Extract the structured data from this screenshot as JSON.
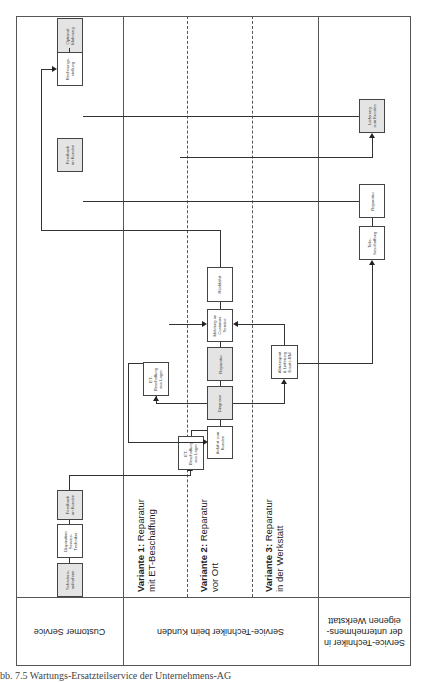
{
  "diagram": {
    "orientation": "rotated-90",
    "lanes_header": [
      {
        "id": "customer-service",
        "label": "Customer Service"
      },
      {
        "id": "service-techniker-kunden",
        "label": "Service-Techniker beim Kunden"
      },
      {
        "id": "service-techniker-werkstatt",
        "label": "Service-Techniker in\nder unternehmens-\neigenen Werkstatt"
      }
    ],
    "variants": [
      {
        "id": "variante-1",
        "bold": "Variante 1:",
        "rest": " Reparatur",
        "line2": "mit ET-Beschaffung"
      },
      {
        "id": "variante-2",
        "bold": "Variante 2:",
        "rest": " Reparatur",
        "line2": "vor Ort"
      },
      {
        "id": "variante-3",
        "bold": "Variante 3:",
        "rest": " Reparatur",
        "line2": "in der Werkstatt"
      }
    ],
    "boxes": {
      "schadensaufnahme": "Schadens-\naufnahme",
      "disposition": "Disposition\nService-\nTechniker",
      "feedback_1": "Feedback\nan Kunden",
      "feedback_2": "Feedback\nan Kunden",
      "rechnungsstellung": "Rechnungs-\nstellung",
      "optional_mahnung": "Optional:\nMahnung",
      "et_lager": "ET-\nBeschaffung\naus Lager",
      "anfahrt": "Anfahrt zum\nKunden",
      "diagnose": "Diagnose",
      "reparatur": "Reparatur",
      "meldung": "Meldung an\nCustomer\nService",
      "rueckfahrt": "Rückfahrt",
      "et_auslager": "ET-\nBeschaffung\naus Lager",
      "abtransport": "Abtransport\n& Lieferung\nErsatz-RM",
      "teilebeschaffung": "Teile-\nbeschaffung",
      "reparatur_werkstatt": "Reparatur",
      "lieferung": "Lieferung\nzum Kunden"
    }
  },
  "caption": "bb. 7.5  Wartungs-Ersatzteilservice der Unternehmens-AG"
}
